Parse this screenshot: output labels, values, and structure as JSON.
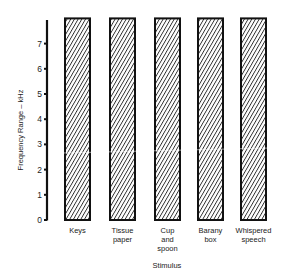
{
  "chart_data": {
    "type": "bar",
    "title": "",
    "xlabel": "Stimulus",
    "ylabel": "Frequency Range – kHz",
    "categories": [
      [
        "Keys"
      ],
      [
        "Tissue",
        "paper"
      ],
      [
        "Cup",
        "and",
        "spoon"
      ],
      [
        "Barany",
        "box"
      ],
      [
        "Whispered",
        "speech"
      ]
    ],
    "category_names": [
      "Keys",
      "Tissue paper",
      "Cup and spoon",
      "Barany box",
      "Whispered speech"
    ],
    "series": [
      {
        "name": "Frequency range",
        "low": [
          0,
          0,
          0,
          0,
          0
        ],
        "high": [
          8,
          8,
          8,
          8,
          8
        ]
      }
    ],
    "values": [
      8,
      8,
      8,
      8,
      8
    ],
    "yticks": [
      0,
      1,
      2,
      3,
      4,
      5,
      6,
      7
    ],
    "ylim": [
      0,
      8
    ],
    "grid": false,
    "legend": "none",
    "bar_fill": "diagonal hatch",
    "colors": {
      "ink": "#1a1a1a",
      "background": "#ffffff"
    }
  }
}
